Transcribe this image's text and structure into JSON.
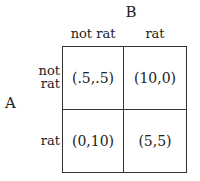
{
  "players": {
    "column_player": "B",
    "row_player": "A"
  },
  "columns": [
    "not rat",
    "rat"
  ],
  "rows": [
    {
      "label_line1": "not",
      "label_line2": "rat"
    },
    {
      "label_line1": "rat"
    }
  ],
  "payoffs": [
    [
      "(.5,.5)",
      "(10,0)"
    ],
    [
      "(0,10)",
      "(5,5)"
    ]
  ]
}
